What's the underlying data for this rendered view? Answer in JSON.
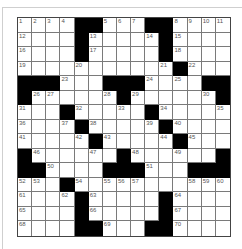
{
  "puzzle": {
    "rows": 15,
    "cols": 15,
    "colors": {
      "block": "#000000",
      "cell": "#ffffff",
      "line": "#7a7a7a",
      "number": "#555555"
    },
    "grid": [
      "....##...##....",
      "....#.....#....",
      "....#.....#....",
      "..........#....",
      "###...###....##",
      "#......#.....#",
      "...#.....#.....",
      "....#....#.....",
      ".....#....#....",
      "#......#......#",
      "##....###...###",
      "...#...........",
      "....#.....#....",
      "....#.....#....",
      "....##...##...."
    ],
    "numbers": [
      {
        "r": 0,
        "c": 0,
        "n": "1"
      },
      {
        "r": 0,
        "c": 1,
        "n": "2"
      },
      {
        "r": 0,
        "c": 2,
        "n": "3"
      },
      {
        "r": 0,
        "c": 3,
        "n": "4"
      },
      {
        "r": 0,
        "c": 6,
        "n": "5"
      },
      {
        "r": 0,
        "c": 7,
        "n": "6"
      },
      {
        "r": 0,
        "c": 8,
        "n": "7"
      },
      {
        "r": 0,
        "c": 11,
        "n": "8"
      },
      {
        "r": 0,
        "c": 12,
        "n": "9"
      },
      {
        "r": 0,
        "c": 13,
        "n": "10"
      },
      {
        "r": 0,
        "c": 14,
        "n": "11"
      },
      {
        "r": 1,
        "c": 0,
        "n": "12"
      },
      {
        "r": 1,
        "c": 5,
        "n": "13"
      },
      {
        "r": 1,
        "c": 9,
        "n": "14"
      },
      {
        "r": 1,
        "c": 11,
        "n": "15"
      },
      {
        "r": 2,
        "c": 0,
        "n": "16"
      },
      {
        "r": 2,
        "c": 5,
        "n": "17"
      },
      {
        "r": 2,
        "c": 11,
        "n": "18"
      },
      {
        "r": 3,
        "c": 0,
        "n": "19"
      },
      {
        "r": 3,
        "c": 4,
        "n": "20"
      },
      {
        "r": 3,
        "c": 10,
        "n": "21"
      },
      {
        "r": 3,
        "c": 12,
        "n": "22"
      },
      {
        "r": 4,
        "c": 3,
        "n": "23"
      },
      {
        "r": 4,
        "c": 9,
        "n": "24"
      },
      {
        "r": 4,
        "c": 11,
        "n": "25"
      },
      {
        "r": 5,
        "c": 1,
        "n": "26"
      },
      {
        "r": 5,
        "c": 2,
        "n": "27"
      },
      {
        "r": 5,
        "c": 6,
        "n": "28"
      },
      {
        "r": 5,
        "c": 8,
        "n": "29"
      },
      {
        "r": 5,
        "c": 13,
        "n": "30"
      },
      {
        "r": 6,
        "c": 0,
        "n": "31"
      },
      {
        "r": 6,
        "c": 4,
        "n": "32"
      },
      {
        "r": 6,
        "c": 7,
        "n": "33"
      },
      {
        "r": 6,
        "c": 10,
        "n": "34"
      },
      {
        "r": 6,
        "c": 14,
        "n": "35"
      },
      {
        "r": 7,
        "c": 0,
        "n": "36"
      },
      {
        "r": 7,
        "c": 3,
        "n": "37"
      },
      {
        "r": 7,
        "c": 5,
        "n": "38"
      },
      {
        "r": 7,
        "c": 9,
        "n": "39"
      },
      {
        "r": 7,
        "c": 11,
        "n": "40"
      },
      {
        "r": 8,
        "c": 0,
        "n": "41"
      },
      {
        "r": 8,
        "c": 4,
        "n": "42"
      },
      {
        "r": 8,
        "c": 6,
        "n": "43"
      },
      {
        "r": 8,
        "c": 10,
        "n": "44"
      },
      {
        "r": 8,
        "c": 12,
        "n": "45"
      },
      {
        "r": 9,
        "c": 1,
        "n": "46"
      },
      {
        "r": 9,
        "c": 5,
        "n": "47"
      },
      {
        "r": 9,
        "c": 8,
        "n": "48"
      },
      {
        "r": 9,
        "c": 11,
        "n": "49"
      },
      {
        "r": 10,
        "c": 2,
        "n": "50"
      },
      {
        "r": 10,
        "c": 9,
        "n": "51"
      },
      {
        "r": 11,
        "c": 0,
        "n": "52"
      },
      {
        "r": 11,
        "c": 1,
        "n": "53"
      },
      {
        "r": 11,
        "c": 4,
        "n": "54"
      },
      {
        "r": 11,
        "c": 6,
        "n": "55"
      },
      {
        "r": 11,
        "c": 7,
        "n": "56"
      },
      {
        "r": 11,
        "c": 8,
        "n": "57"
      },
      {
        "r": 11,
        "c": 12,
        "n": "58"
      },
      {
        "r": 11,
        "c": 13,
        "n": "59"
      },
      {
        "r": 11,
        "c": 14,
        "n": "60"
      },
      {
        "r": 12,
        "c": 0,
        "n": "61"
      },
      {
        "r": 12,
        "c": 3,
        "n": "62"
      },
      {
        "r": 12,
        "c": 5,
        "n": "63"
      },
      {
        "r": 12,
        "c": 11,
        "n": "64"
      },
      {
        "r": 13,
        "c": 0,
        "n": "65"
      },
      {
        "r": 13,
        "c": 5,
        "n": "66"
      },
      {
        "r": 13,
        "c": 11,
        "n": "67"
      },
      {
        "r": 14,
        "c": 0,
        "n": "68"
      },
      {
        "r": 14,
        "c": 6,
        "n": "69"
      },
      {
        "r": 14,
        "c": 11,
        "n": "70"
      }
    ]
  }
}
